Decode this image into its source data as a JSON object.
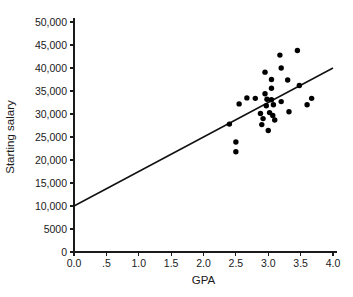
{
  "chart_data": {
    "type": "scatter",
    "title": "",
    "xlabel": "GPA",
    "ylabel": "Starting salary",
    "xlim": [
      0.0,
      4.0
    ],
    "ylim": [
      0,
      50000
    ],
    "grid": false,
    "legend": "none",
    "x_tick_labels": [
      "0.0",
      ".5",
      "1.0",
      "1.5",
      "2.0",
      "2.5",
      "3.0",
      "3.5",
      "4.0"
    ],
    "x_tick_values": [
      0.0,
      0.5,
      1.0,
      1.5,
      2.0,
      2.5,
      3.0,
      3.5,
      4.0
    ],
    "y_tick_labels": [
      "0",
      "5000",
      "10,000",
      "15,000",
      "20,000",
      "25,000",
      "30,000",
      "35,000",
      "40,000",
      "45,000",
      "50,000"
    ],
    "y_tick_values": [
      0,
      5000,
      10000,
      15000,
      20000,
      25000,
      30000,
      35000,
      40000,
      45000,
      50000
    ],
    "series": [
      {
        "name": "Students",
        "marker": "filled-circle",
        "color": "#000000",
        "points": [
          [
            2.4,
            27800
          ],
          [
            2.5,
            23900
          ],
          [
            2.5,
            21800
          ],
          [
            2.55,
            32200
          ],
          [
            2.67,
            33500
          ],
          [
            2.8,
            33400
          ],
          [
            2.88,
            30100
          ],
          [
            2.9,
            27700
          ],
          [
            2.92,
            29000
          ],
          [
            2.95,
            39100
          ],
          [
            2.95,
            34400
          ],
          [
            2.97,
            31800
          ],
          [
            2.98,
            33200
          ],
          [
            3.0,
            26400
          ],
          [
            3.02,
            30300
          ],
          [
            3.05,
            37500
          ],
          [
            3.05,
            35600
          ],
          [
            3.05,
            33100
          ],
          [
            3.07,
            29700
          ],
          [
            3.08,
            32000
          ],
          [
            3.1,
            28700
          ],
          [
            3.18,
            42800
          ],
          [
            3.2,
            40000
          ],
          [
            3.2,
            32700
          ],
          [
            3.3,
            37400
          ],
          [
            3.32,
            30500
          ],
          [
            3.45,
            43800
          ],
          [
            3.48,
            36200
          ],
          [
            3.6,
            32000
          ],
          [
            3.67,
            33400
          ]
        ]
      }
    ],
    "trendline": {
      "type": "linear-regression",
      "label": "",
      "color": "#111111",
      "intercept": 10000,
      "slope": 7500,
      "x_start": 0.0,
      "y_start": 10000,
      "x_end": 4.0,
      "y_end": 40000
    }
  }
}
